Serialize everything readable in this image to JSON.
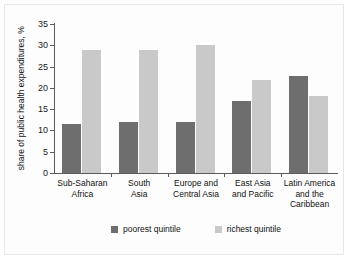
{
  "chart_data": {
    "type": "bar",
    "title": "",
    "xlabel": "",
    "ylabel": "share of public health expenditures, %",
    "ylim": [
      0,
      35
    ],
    "yticks": [
      0,
      5,
      10,
      15,
      20,
      25,
      30,
      35
    ],
    "grid": false,
    "legend_position": "bottom",
    "categories": [
      "Sub-Saharan Africa",
      "South Asia",
      "Europe and Central Asia",
      "East Asia and Pacific",
      "Latin America and the Caribbean"
    ],
    "category_lines": [
      [
        "Sub-Saharan",
        "Africa"
      ],
      [
        "South",
        "Asia"
      ],
      [
        "Europe and",
        "Central Asia"
      ],
      [
        "East Asia",
        "and Pacific"
      ],
      [
        "Latin America",
        "and the",
        "Caribbean"
      ]
    ],
    "series": [
      {
        "name": "poorest quintile",
        "color": "#6e6e6e",
        "values": [
          11.5,
          12.0,
          12.0,
          17.0,
          22.8
        ]
      },
      {
        "name": "richest quintile",
        "color": "#c9c9c9",
        "values": [
          29.0,
          29.0,
          30.0,
          21.8,
          18.0
        ]
      }
    ]
  },
  "legend": {
    "items": [
      {
        "label": "poorest quintile",
        "color": "#6e6e6e"
      },
      {
        "label": "richest quintile",
        "color": "#c9c9c9"
      }
    ]
  },
  "colors": {
    "poorest": "#6e6e6e",
    "richest": "#c9c9c9",
    "axis": "#5a5a5a",
    "text": "#111111",
    "background": "#fdfdfd",
    "border": "#e8e8e8"
  }
}
